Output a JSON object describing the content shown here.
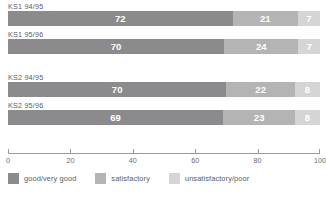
{
  "chart_data": {
    "type": "bar",
    "orientation": "horizontal",
    "stacked": true,
    "stack_total": 100,
    "title": "",
    "xlabel": "",
    "ylabel": "",
    "xlim": [
      0,
      100
    ],
    "xticks": [
      0,
      20,
      40,
      60,
      80,
      100
    ],
    "xtick_labels": [
      "0",
      "20",
      "40",
      "60",
      "80",
      "100"
    ],
    "grid": false,
    "legend_position": "bottom-left",
    "categories": [
      "KS1 94/95",
      "KS1 95/96",
      "KS2 94/95",
      "KS2 95/96"
    ],
    "series": [
      {
        "name": "good/very good",
        "color": "#8b8b8d",
        "values": [
          72,
          70,
          70,
          69
        ]
      },
      {
        "name": "satisfactory",
        "color": "#b4b4b5",
        "values": [
          21,
          24,
          22,
          23
        ]
      },
      {
        "name": "unsatisfactory/poor",
        "color": "#d5d5d6",
        "values": [
          7,
          7,
          8,
          8
        ]
      }
    ],
    "bars": [
      {
        "label": "KS1 94/95",
        "segments": [
          {
            "series": "good/very good",
            "value": 72,
            "display": "72"
          },
          {
            "series": "satisfactory",
            "value": 21,
            "display": "21"
          },
          {
            "series": "unsatisfactory/poor",
            "value": 7,
            "display": "7"
          }
        ]
      },
      {
        "label": "KS1 95/96",
        "segments": [
          {
            "series": "good/very good",
            "value": 70,
            "display": "70"
          },
          {
            "series": "satisfactory",
            "value": 24,
            "display": "24"
          },
          {
            "series": "unsatisfactory/poor",
            "value": 7,
            "display": "7"
          }
        ]
      },
      {
        "label": "KS2 94/95",
        "segments": [
          {
            "series": "good/very good",
            "value": 70,
            "display": "70"
          },
          {
            "series": "satisfactory",
            "value": 22,
            "display": "22"
          },
          {
            "series": "unsatisfactory/poor",
            "value": 8,
            "display": "8"
          }
        ]
      },
      {
        "label": "KS2 95/96",
        "segments": [
          {
            "series": "good/very good",
            "value": 69,
            "display": "69"
          },
          {
            "series": "satisfactory",
            "value": 23,
            "display": "23"
          },
          {
            "series": "unsatisfactory/poor",
            "value": 8,
            "display": "8"
          }
        ]
      }
    ],
    "legend": [
      {
        "label": "good/very good",
        "color": "#8b8b8d"
      },
      {
        "label": "satisfactory",
        "color": "#b4b4b5"
      },
      {
        "label": "unsatisfactory/poor",
        "color": "#d5d5d6"
      }
    ]
  }
}
